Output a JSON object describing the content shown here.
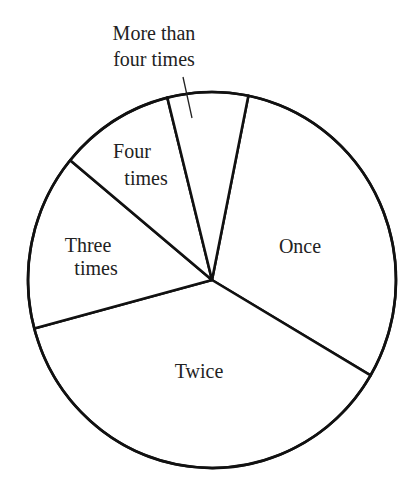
{
  "chart_data": {
    "type": "pie",
    "title": "",
    "categories": [
      "Once",
      "Twice",
      "Three times",
      "Four times",
      "More than four times"
    ],
    "values": [
      30,
      37,
      15,
      10,
      7
    ],
    "unit": "approximate percent of circle (no values printed)",
    "start_angle_deg": 11.4,
    "direction": "clockwise",
    "boundary_angles_deg_from_top_clockwise": [
      11.4,
      119.8,
      254.0,
      309.5,
      345.4
    ],
    "legend": "none (labels placed inside slices; leader line for smallest slice)",
    "fill": "#ffffff",
    "stroke": "#111111"
  },
  "labels": {
    "once": [
      "Once"
    ],
    "twice": [
      "Twice"
    ],
    "three_times": [
      "Three",
      "times"
    ],
    "four_times": [
      "Four",
      "times"
    ],
    "more_than_four": [
      "More than",
      "four times"
    ]
  }
}
